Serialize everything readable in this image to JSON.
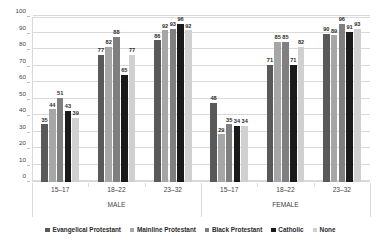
{
  "chart_data": {
    "type": "bar",
    "title": "",
    "subtitle": "",
    "xlabel": "",
    "ylabel": "",
    "ylim": [
      0,
      100
    ],
    "yticks": [
      0,
      10,
      20,
      30,
      40,
      50,
      60,
      70,
      80,
      90,
      100
    ],
    "grid": true,
    "legend_position": "bottom",
    "categories": [
      "15–17",
      "18–22",
      "23–32",
      "15–17",
      "18–22",
      "23–32"
    ],
    "group_headers": [
      "MALE",
      "FEMALE"
    ],
    "panels": [
      {
        "name": "MALE",
        "categories": [
          "15–17",
          "18–22",
          "23–32"
        ]
      },
      {
        "name": "FEMALE",
        "categories": [
          "15–17",
          "18–22",
          "23–32"
        ]
      }
    ],
    "series": [
      {
        "name": "Evangelical Protestant",
        "color": "#595959",
        "values": [
          35,
          77,
          86,
          48,
          71,
          90
        ]
      },
      {
        "name": "Mainline Protestant",
        "color": "#a6a6a6",
        "values": [
          44,
          82,
          92,
          29,
          85,
          89
        ]
      },
      {
        "name": "Black Protestant",
        "color": "#7f7f7f",
        "values": [
          51,
          88,
          93,
          35,
          85,
          96
        ]
      },
      {
        "name": "Catholic",
        "color": "#1a1a1a",
        "values": [
          43,
          65,
          96,
          34,
          71,
          91
        ]
      },
      {
        "name": "None",
        "color": "#d0d0d0",
        "values": [
          39,
          77,
          92,
          34,
          82,
          93
        ]
      }
    ]
  },
  "legend": {
    "items": [
      {
        "label": "Evangelical Protestant",
        "color": "#595959"
      },
      {
        "label": "Mainline Protestant",
        "color": "#a6a6a6"
      },
      {
        "label": "Black Protestant",
        "color": "#7f7f7f"
      },
      {
        "label": "Catholic",
        "color": "#1a1a1a"
      },
      {
        "label": "None",
        "color": "#d0d0d0"
      }
    ]
  }
}
